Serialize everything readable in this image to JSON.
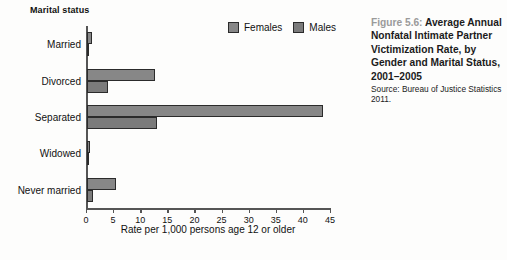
{
  "figure": {
    "number_label": "Figure 5.6:",
    "title": "Average Annual Nonfatal Intimate Partner Victimization Rate, by Gender and Marital Status, 2001–2005",
    "source": "Source: Bureau of Justice Statistics 2011."
  },
  "legend": {
    "position": "top-right",
    "items": [
      {
        "label": "Females",
        "color": "#878787"
      },
      {
        "label": "Males",
        "color": "#7b7b7b"
      }
    ]
  },
  "axes": {
    "y_title": "Marital status",
    "x_title": "Rate per 1,000 persons age 12 or older",
    "x_ticks": [
      "0",
      "5",
      "10",
      "15",
      "20",
      "25",
      "30",
      "35",
      "40",
      "45"
    ]
  },
  "chart_data": {
    "type": "bar",
    "orientation": "horizontal",
    "title": "Average Annual Nonfatal Intimate Partner Victimization Rate, by Gender and Marital Status, 2001–2005",
    "xlabel": "Rate per 1,000 persons age 12 or older",
    "ylabel": "Marital status",
    "xlim": [
      0,
      45
    ],
    "xticks": [
      0,
      5,
      10,
      15,
      20,
      25,
      30,
      35,
      40,
      45
    ],
    "grid": false,
    "legend_position": "top-right",
    "categories": [
      "Married",
      "Divorced",
      "Separated",
      "Widowed",
      "Never married"
    ],
    "series": [
      {
        "name": "Females",
        "color": "#878787",
        "values": [
          1.0,
          12.6,
          43.5,
          0.6,
          5.3
        ]
      },
      {
        "name": "Males",
        "color": "#7b7b7b",
        "values": [
          0.2,
          3.8,
          13.0,
          0.2,
          1.1
        ]
      }
    ],
    "source": "Bureau of Justice Statistics 2011"
  }
}
